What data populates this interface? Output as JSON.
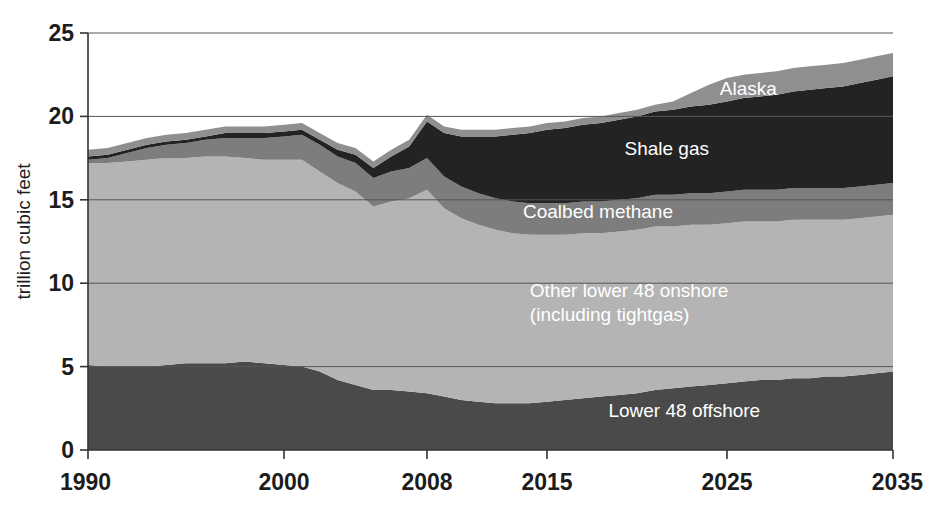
{
  "chart_data": {
    "type": "area",
    "stacked": true,
    "title": "",
    "subtitle": "",
    "xlabel": "",
    "ylabel": "trillion cubic feet",
    "xlim": [
      1990,
      2035
    ],
    "ylim": [
      0,
      25
    ],
    "yticks": [
      0,
      5,
      10,
      15,
      20,
      25
    ],
    "ytick_labels": [
      "0",
      "5",
      "10",
      "15",
      "20",
      "25"
    ],
    "xticks": [
      1990,
      2000,
      2008,
      2015,
      2025,
      2035
    ],
    "xtick_labels": [
      "1990",
      "2000",
      "2008",
      "2015",
      "2025",
      "2035"
    ],
    "grid": "horizontal",
    "legend_position": "inline-labels",
    "x": [
      1990,
      1991,
      1992,
      1993,
      1994,
      1995,
      1996,
      1997,
      1998,
      1999,
      2000,
      2001,
      2002,
      2003,
      2004,
      2005,
      2006,
      2007,
      2008,
      2009,
      2010,
      2011,
      2012,
      2013,
      2014,
      2015,
      2016,
      2017,
      2018,
      2019,
      2020,
      2021,
      2022,
      2023,
      2024,
      2025,
      2026,
      2027,
      2028,
      2029,
      2030,
      2031,
      2032,
      2033,
      2034,
      2035
    ],
    "series": [
      {
        "name": "Lower 48 offshore",
        "color": "#4a4a4a",
        "label_x": 2027,
        "label_y": 2.0,
        "values": [
          5.1,
          5.0,
          5.0,
          5.0,
          5.1,
          5.2,
          5.2,
          5.2,
          5.3,
          5.2,
          5.1,
          5.0,
          4.7,
          4.2,
          3.9,
          3.6,
          3.6,
          3.5,
          3.4,
          3.2,
          3.0,
          2.9,
          2.8,
          2.8,
          2.8,
          2.9,
          3.0,
          3.1,
          3.2,
          3.3,
          3.4,
          3.6,
          3.7,
          3.8,
          3.9,
          4.0,
          4.1,
          4.2,
          4.2,
          4.3,
          4.3,
          4.4,
          4.4,
          4.5,
          4.6,
          4.7
        ]
      },
      {
        "name": "Other lower 48 onshore (including tightgas)",
        "color": "#b4b4b4",
        "label_x": 2014,
        "label_y": 9.2,
        "values": [
          12.1,
          12.2,
          12.3,
          12.4,
          12.4,
          12.3,
          12.4,
          12.4,
          12.2,
          12.2,
          12.3,
          12.4,
          12.0,
          11.8,
          11.6,
          11.0,
          11.3,
          11.6,
          12.2,
          11.3,
          10.9,
          10.6,
          10.4,
          10.2,
          10.1,
          10.0,
          9.9,
          9.9,
          9.8,
          9.8,
          9.8,
          9.8,
          9.7,
          9.7,
          9.6,
          9.6,
          9.6,
          9.5,
          9.5,
          9.5,
          9.5,
          9.4,
          9.4,
          9.4,
          9.4,
          9.4
        ]
      },
      {
        "name": "Coalbed methane",
        "color": "#7d7d7d",
        "label_x": 2022,
        "label_y": 13.9,
        "values": [
          0.2,
          0.3,
          0.5,
          0.7,
          0.8,
          0.9,
          1.0,
          1.1,
          1.2,
          1.3,
          1.4,
          1.5,
          1.6,
          1.6,
          1.7,
          1.7,
          1.8,
          1.8,
          1.9,
          1.9,
          1.9,
          1.9,
          1.9,
          1.9,
          1.9,
          1.9,
          1.9,
          1.9,
          1.9,
          1.9,
          1.9,
          1.9,
          1.9,
          1.9,
          1.9,
          1.9,
          1.9,
          1.9,
          1.9,
          1.9,
          1.9,
          1.9,
          1.9,
          1.9,
          1.9,
          1.9
        ]
      },
      {
        "name": "Shale gas",
        "color": "#232323",
        "label_x": 2024,
        "label_y": 17.7,
        "values": [
          0.2,
          0.2,
          0.2,
          0.2,
          0.2,
          0.2,
          0.2,
          0.3,
          0.3,
          0.3,
          0.3,
          0.3,
          0.3,
          0.4,
          0.5,
          0.6,
          0.9,
          1.3,
          2.2,
          2.6,
          3.0,
          3.4,
          3.7,
          4.0,
          4.2,
          4.4,
          4.5,
          4.6,
          4.7,
          4.8,
          4.9,
          5.0,
          5.1,
          5.2,
          5.3,
          5.4,
          5.5,
          5.6,
          5.7,
          5.8,
          5.9,
          6.0,
          6.1,
          6.2,
          6.3,
          6.4
        ]
      },
      {
        "name": "Alaska",
        "color": "#8f8f8f",
        "label_x": 2028,
        "label_y": 21.3,
        "values": [
          0.4,
          0.4,
          0.4,
          0.4,
          0.4,
          0.4,
          0.4,
          0.4,
          0.4,
          0.4,
          0.4,
          0.4,
          0.4,
          0.4,
          0.4,
          0.4,
          0.4,
          0.4,
          0.4,
          0.4,
          0.4,
          0.4,
          0.4,
          0.4,
          0.4,
          0.4,
          0.4,
          0.4,
          0.4,
          0.4,
          0.4,
          0.4,
          0.5,
          0.8,
          1.2,
          1.4,
          1.4,
          1.4,
          1.4,
          1.4,
          1.4,
          1.4,
          1.4,
          1.4,
          1.4,
          1.4
        ]
      }
    ],
    "series_labels_multiline": {
      "Other lower 48 onshore (including tightgas)": [
        "Other lower 48 onshore",
        "(including tightgas)"
      ]
    }
  }
}
